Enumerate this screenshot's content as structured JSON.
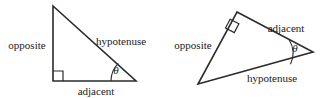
{
  "figure": {
    "background_color": "#ffffff",
    "stroke_color": "#2b2b2b",
    "text_color": "#1a1a1a",
    "width": 326,
    "height": 98
  },
  "diagrams": [
    {
      "id": "left-triangle",
      "name": "upright-right-triangle",
      "orientation": "upright",
      "vertices": {
        "apex": [
          53,
          6
        ],
        "right_angle": [
          53,
          81
        ],
        "theta_vertex": [
          136,
          81
        ]
      },
      "right_angle_marker": {
        "type": "square",
        "corner": [
          53,
          81
        ],
        "size": 10
      },
      "angle_arc": {
        "center": [
          136,
          81
        ],
        "radius": 25,
        "label": "θ",
        "label_position": [
          116,
          70
        ]
      },
      "labels": {
        "opposite": {
          "text": "opposite",
          "position": [
            27,
            45
          ]
        },
        "hypotenuse": {
          "text": "hypotenuse",
          "position": [
            121,
            41
          ]
        },
        "adjacent": {
          "text": "adjacent",
          "position": [
            96,
            91
          ]
        }
      }
    },
    {
      "id": "right-triangle",
      "name": "rotated-right-triangle",
      "orientation": "rotated",
      "vertices": {
        "right_angle": [
          237,
          12
        ],
        "theta_vertex": [
          313,
          52
        ],
        "far_vertex": [
          198,
          84
        ]
      },
      "right_angle_marker": {
        "type": "square",
        "corner": [
          237,
          12
        ],
        "size": 10
      },
      "angle_arc": {
        "center": [
          313,
          52
        ],
        "radius": 26,
        "label": "θ",
        "label_position": [
          295,
          48
        ]
      },
      "labels": {
        "opposite": {
          "text": "opposite",
          "position": [
            193,
            45
          ]
        },
        "adjacent": {
          "text": "adjacent",
          "position": [
            286,
            28
          ]
        },
        "hypotenuse": {
          "text": "hypotenuse",
          "position": [
            272,
            78
          ]
        }
      }
    }
  ]
}
